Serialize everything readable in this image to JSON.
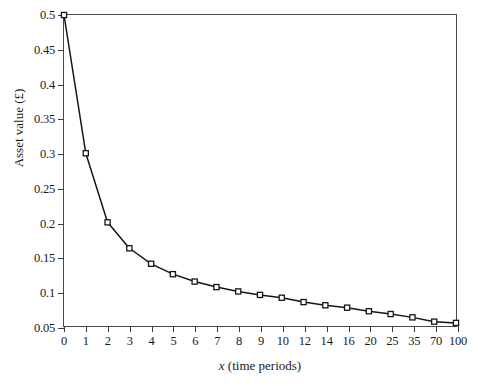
{
  "chart_data": {
    "type": "line",
    "title": "",
    "subtitle": "",
    "xlabel_prefix": "x",
    "xlabel_suffix": " (time periods)",
    "xlabel": "x (time periods)",
    "ylabel": "Asset value (£)",
    "annotation": {
      "var": "v",
      "text": "v = 0.05 + 0.45/(x + 1)",
      "formula_parts": [
        "v",
        " = 0.05 + 0.45/(",
        "x",
        " + 1)"
      ]
    },
    "categories": [
      "0",
      "1",
      "2",
      "3",
      "4",
      "5",
      "6",
      "7",
      "8",
      "9",
      "10",
      "12",
      "14",
      "16",
      "20",
      "25",
      "35",
      "70",
      "100"
    ],
    "x": [
      0,
      1,
      2,
      3,
      4,
      5,
      6,
      7,
      8,
      9,
      10,
      12,
      14,
      16,
      20,
      25,
      35,
      70,
      100
    ],
    "values": [
      0.5,
      0.3,
      0.2,
      0.1625,
      0.14,
      0.125,
      0.1143,
      0.1063,
      0.1,
      0.095,
      0.0909,
      0.0846,
      0.08,
      0.0765,
      0.0714,
      0.0673,
      0.0625,
      0.0563,
      0.0545
    ],
    "series": [
      {
        "name": "Asset value",
        "values": [
          0.5,
          0.3,
          0.2,
          0.1625,
          0.14,
          0.125,
          0.1143,
          0.1063,
          0.1,
          0.095,
          0.0909,
          0.0846,
          0.08,
          0.0765,
          0.0714,
          0.0673,
          0.0625,
          0.0563,
          0.0545
        ],
        "marker": "open-square",
        "line_color": "#151515",
        "marker_color": "#151515"
      }
    ],
    "yticks": [
      "0.05",
      "0.1",
      "0.15",
      "0.2",
      "0.25",
      "0.3",
      "0.35",
      "0.4",
      "0.45",
      "0.5"
    ],
    "ytick_values": [
      0.05,
      0.1,
      0.15,
      0.2,
      0.25,
      0.3,
      0.35,
      0.4,
      0.45,
      0.5
    ],
    "ylim": [
      0.05,
      0.5
    ],
    "xlim_index": [
      0,
      18
    ],
    "grid": false,
    "legend": "none",
    "axis_color": "#4a4a4a",
    "background": "#ffffff"
  }
}
